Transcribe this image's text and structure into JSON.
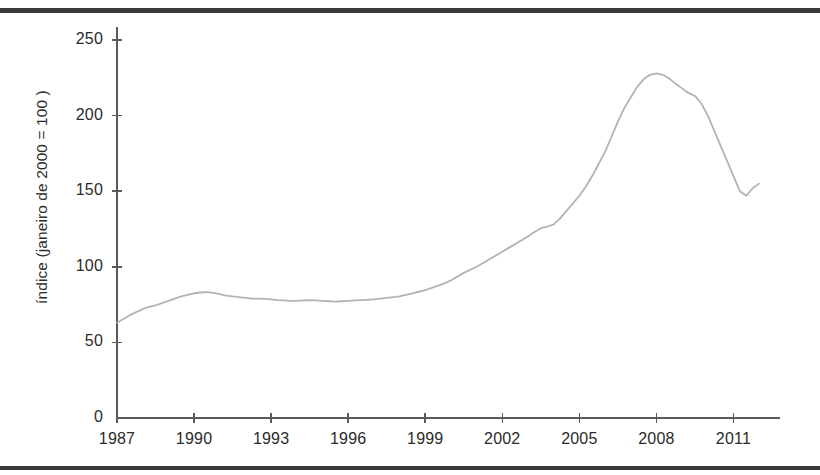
{
  "chart_data": {
    "type": "line",
    "title": "",
    "subtitle": "",
    "xlabel": "",
    "ylabel": "índice (janeiro de 2000 = 100 )",
    "xlim": [
      1987,
      2012.5
    ],
    "ylim": [
      0,
      250
    ],
    "grid": false,
    "legend": null,
    "line_color": "#b3b3b3",
    "axis_color": "#5a5a5a",
    "text_color": "#2b2b2b",
    "ytick_labels": [
      "0",
      "50",
      "100",
      "150",
      "200",
      "250"
    ],
    "ytick_values": [
      0,
      50,
      100,
      150,
      200,
      250
    ],
    "xtick_labels": [
      "1987",
      "1990",
      "1993",
      "1996",
      "1999",
      "2002",
      "2005",
      "2008",
      "2011"
    ],
    "xtick_values": [
      1987,
      1990,
      1993,
      1996,
      1999,
      2002,
      2005,
      2008,
      2011
    ],
    "series": [
      {
        "name": "índice",
        "x": [
          1987.0,
          1987.25,
          1987.5,
          1987.75,
          1988.0,
          1988.25,
          1988.5,
          1988.75,
          1989.0,
          1989.25,
          1989.5,
          1989.75,
          1990.0,
          1990.25,
          1990.5,
          1990.75,
          1991.0,
          1991.25,
          1991.5,
          1991.75,
          1992.0,
          1992.25,
          1992.5,
          1992.75,
          1993.0,
          1993.25,
          1993.5,
          1993.75,
          1994.0,
          1994.25,
          1994.5,
          1994.75,
          1995.0,
          1995.25,
          1995.5,
          1995.75,
          1996.0,
          1996.25,
          1996.5,
          1996.75,
          1997.0,
          1997.25,
          1997.5,
          1997.75,
          1998.0,
          1998.25,
          1998.5,
          1998.75,
          1999.0,
          1999.25,
          1999.5,
          1999.75,
          2000.0,
          2000.25,
          2000.5,
          2000.75,
          2001.0,
          2001.25,
          2001.5,
          2001.75,
          2002.0,
          2002.25,
          2002.5,
          2002.75,
          2003.0,
          2003.25,
          2003.5,
          2003.75,
          2004.0,
          2004.25,
          2004.5,
          2004.75,
          2005.0,
          2005.25,
          2005.5,
          2005.75,
          2006.0,
          2006.25,
          2006.5,
          2006.75,
          2007.0,
          2007.25,
          2007.5,
          2007.75,
          2008.0,
          2008.25,
          2008.5,
          2008.75,
          2009.0,
          2009.25,
          2009.5,
          2009.75,
          2010.0,
          2010.25,
          2010.5,
          2010.75,
          2011.0,
          2011.25,
          2011.5,
          2011.75,
          2012.0
        ],
        "y": [
          63.0,
          65.5,
          68.0,
          70.0,
          72.0,
          73.5,
          74.5,
          76.0,
          77.5,
          79.0,
          80.5,
          81.5,
          82.5,
          83.0,
          83.2,
          82.8,
          82.0,
          81.0,
          80.5,
          80.0,
          79.5,
          79.0,
          79.0,
          78.8,
          78.5,
          78.0,
          77.8,
          77.5,
          77.5,
          77.8,
          78.0,
          77.8,
          77.5,
          77.2,
          77.0,
          77.2,
          77.5,
          77.8,
          78.0,
          78.2,
          78.5,
          79.0,
          79.5,
          80.0,
          80.5,
          81.5,
          82.5,
          83.5,
          84.5,
          86.0,
          87.5,
          89.0,
          91.0,
          93.5,
          96.0,
          98.0,
          100.0,
          102.5,
          105.0,
          107.5,
          110.0,
          112.5,
          115.0,
          117.5,
          120.0,
          123.0,
          125.5,
          126.5,
          128.0,
          132.0,
          137.0,
          142.0,
          147.0,
          153.0,
          160.0,
          168.0,
          176.0,
          186.0,
          196.0,
          205.0,
          212.0,
          219.0,
          224.0,
          227.0,
          228.0,
          227.0,
          224.5,
          221.0,
          218.0,
          215.0,
          213.0,
          208.0,
          200.0,
          190.0,
          180.0,
          170.0,
          160.0,
          150.0,
          147.0,
          152.0,
          155.0
        ]
      }
    ],
    "annotations": [
      {
        "label": "start",
        "year": 1987,
        "value": 63
      },
      {
        "label": "plateau",
        "year": 1990,
        "value": 83
      },
      {
        "label": "trough",
        "year": 1996,
        "value": 77
      },
      {
        "label": "peak",
        "year": 2006,
        "value": 228
      },
      {
        "label": "post-crash-low",
        "year": 2009,
        "value": 147
      },
      {
        "label": "end",
        "year": 2012,
        "value": 153
      }
    ]
  }
}
